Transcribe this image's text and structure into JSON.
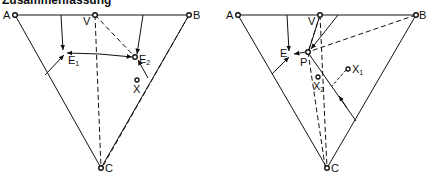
{
  "title": "Zusammenfassung",
  "diagrams": [
    {
      "id": "left",
      "points": {
        "A": {
          "label": "A",
          "x": 15,
          "y": 15
        },
        "V": {
          "label": "V",
          "x": 95,
          "y": 15
        },
        "B": {
          "label": "B",
          "x": 189,
          "y": 15
        },
        "C": {
          "label": "C",
          "x": 101,
          "y": 168
        },
        "E1": {
          "label": "E",
          "sub": "1",
          "x": 66,
          "y": 53
        },
        "E2": {
          "label": "E",
          "sub": "2",
          "x": 135,
          "y": 57
        },
        "X": {
          "label": "X",
          "x": 137,
          "y": 80
        }
      }
    },
    {
      "id": "right",
      "points": {
        "A": {
          "label": "A",
          "x": 238,
          "y": 15
        },
        "V": {
          "label": "V",
          "x": 320,
          "y": 15
        },
        "B": {
          "label": "B",
          "x": 416,
          "y": 15
        },
        "C": {
          "label": "C",
          "x": 327,
          "y": 168
        },
        "E": {
          "label": "E",
          "x": 291,
          "y": 55
        },
        "P": {
          "label": "P",
          "x": 308,
          "y": 52
        },
        "X1": {
          "label": "X",
          "sub": "1",
          "x": 348,
          "y": 69
        },
        "X2": {
          "label": "X",
          "sub": "2",
          "x": 318,
          "y": 77
        }
      }
    }
  ],
  "colors": {
    "ink": "#111111",
    "background": "#ffffff"
  }
}
